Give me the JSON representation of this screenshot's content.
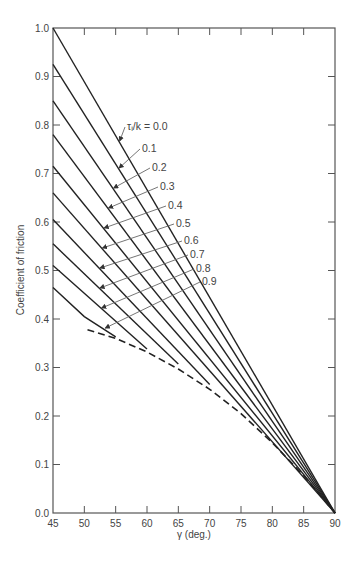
{
  "chart_data": {
    "type": "line",
    "title": "",
    "xlabel": "γ (deg.)",
    "ylabel": "Coefficient of friction",
    "xlim": [
      45,
      90
    ],
    "ylim": [
      0.0,
      1.0
    ],
    "x_ticks": [
      "45",
      "50",
      "55",
      "60",
      "65",
      "70",
      "75",
      "80",
      "85",
      "90"
    ],
    "y_ticks": [
      "0.0",
      "0.1",
      "0.2",
      "0.3",
      "0.4",
      "0.5",
      "0.6",
      "0.7",
      "0.8",
      "0.9",
      "1.0"
    ],
    "grid": false,
    "legend_title": "τᵢ/k = ",
    "series": [
      {
        "name": "0.0",
        "label": "τᵢ/k = 0.0",
        "style": "solid",
        "points": [
          [
            45,
            1.0
          ],
          [
            90,
            0.0
          ]
        ]
      },
      {
        "name": "0.1",
        "label": "0.1",
        "style": "solid",
        "points": [
          [
            45,
            0.925
          ],
          [
            90,
            0.0
          ]
        ]
      },
      {
        "name": "0.2",
        "label": "0.2",
        "style": "solid",
        "points": [
          [
            45,
            0.85
          ],
          [
            90,
            0.0
          ]
        ]
      },
      {
        "name": "0.3",
        "label": "0.3",
        "style": "solid",
        "points": [
          [
            45,
            0.78
          ],
          [
            90,
            0.0
          ]
        ]
      },
      {
        "name": "0.4",
        "label": "0.4",
        "style": "solid",
        "points": [
          [
            45,
            0.715
          ],
          [
            90,
            0.0
          ]
        ]
      },
      {
        "name": "0.5",
        "label": "0.5",
        "style": "solid",
        "points": [
          [
            45,
            0.66
          ],
          [
            90,
            0.0
          ]
        ]
      },
      {
        "name": "0.6",
        "label": "0.6",
        "style": "solid",
        "points": [
          [
            45,
            0.605
          ],
          [
            70,
            0.265
          ]
        ]
      },
      {
        "name": "0.7",
        "label": "0.7",
        "style": "solid",
        "points": [
          [
            45,
            0.555
          ],
          [
            65,
            0.307
          ]
        ]
      },
      {
        "name": "0.8",
        "label": "0.8",
        "style": "solid",
        "points": [
          [
            45,
            0.51
          ],
          [
            60,
            0.338
          ]
        ]
      },
      {
        "name": "0.9",
        "label": "0.9",
        "style": "solid",
        "points": [
          [
            45,
            0.465
          ],
          [
            50,
            0.405
          ],
          [
            55,
            0.363
          ]
        ]
      },
      {
        "name": "limit",
        "label": "",
        "style": "dashed",
        "points": [
          [
            50.5,
            0.378
          ],
          [
            55,
            0.36
          ],
          [
            60,
            0.332
          ],
          [
            65,
            0.297
          ],
          [
            70,
            0.255
          ],
          [
            75,
            0.205
          ],
          [
            80,
            0.145
          ],
          [
            85,
            0.077
          ],
          [
            90,
            0.0
          ]
        ]
      }
    ],
    "annotations": [
      {
        "text": "τᵢ/k = 0.0",
        "series": "0.0",
        "label_at": [
          127,
          130
        ],
        "arrow_to": [
          109,
          141
        ]
      },
      {
        "text": "0.1",
        "series": "0.1",
        "label_at": [
          142,
          152
        ],
        "arrow_to": [
          109,
          168
        ]
      },
      {
        "text": "0.2",
        "series": "0.2",
        "label_at": [
          152,
          171
        ],
        "arrow_to": [
          109,
          188
        ]
      },
      {
        "text": "0.3",
        "series": "0.3",
        "label_at": [
          160,
          190
        ],
        "arrow_to": [
          109,
          208
        ]
      },
      {
        "text": "0.4",
        "series": "0.4",
        "label_at": [
          168,
          209
        ],
        "arrow_to": [
          109,
          228
        ]
      },
      {
        "text": "0.5",
        "series": "0.5",
        "label_at": [
          176,
          227
        ],
        "arrow_to": [
          109,
          248
        ]
      },
      {
        "text": "0.6",
        "series": "0.6",
        "label_at": [
          184,
          244
        ],
        "arrow_to": [
          109,
          268
        ]
      },
      {
        "text": "0.7",
        "series": "0.7",
        "label_at": [
          190,
          258
        ],
        "arrow_to": [
          109,
          288
        ]
      },
      {
        "text": "0.8",
        "series": "0.8",
        "label_at": [
          196,
          272
        ],
        "arrow_to": [
          109,
          308
        ]
      },
      {
        "text": "0.9",
        "series": "0.9",
        "label_at": [
          202,
          285
        ],
        "arrow_to": [
          109,
          328
        ]
      }
    ]
  },
  "labels": {
    "xlabel": "γ (deg.)",
    "ylabel": "Coefficient of friction"
  },
  "colors": {
    "line": "#222222",
    "axis": "#555555",
    "text": "#444444",
    "leader": "#666666"
  }
}
